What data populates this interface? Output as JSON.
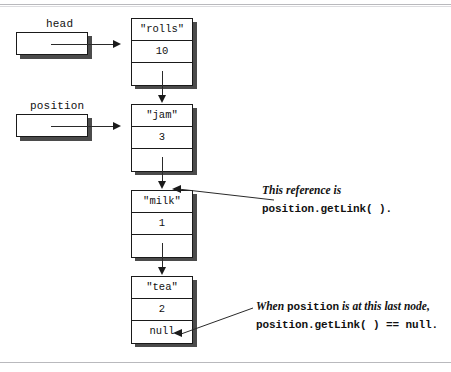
{
  "diagram": {
    "references": [
      {
        "id": "head",
        "label": "head",
        "points_to": "node-rolls"
      },
      {
        "id": "position",
        "label": "position",
        "points_to": "node-jam"
      }
    ],
    "nodes": [
      {
        "id": "node-rolls",
        "data": "\"rolls\"",
        "count": "10",
        "link": ""
      },
      {
        "id": "node-jam",
        "data": "\"jam\"",
        "count": "3",
        "link": ""
      },
      {
        "id": "node-milk",
        "data": "\"milk\"",
        "count": "1",
        "link": ""
      },
      {
        "id": "node-tea",
        "data": "\"tea\"",
        "count": "2",
        "link": "null"
      }
    ],
    "annotations": [
      {
        "id": "annotation-getlink",
        "line1_italic": "This reference is",
        "line2_mono": "position.getLink( )."
      },
      {
        "id": "annotation-null",
        "line1_prefix_italic": "When ",
        "line1_mono": "position",
        "line1_suffix_italic": " is at this last node,",
        "line2_mono": "position.getLink( ) == null."
      }
    ],
    "colors": {
      "ink": "#111111",
      "stroke": "#1a1a1a",
      "shadow": "#4b4b4b",
      "rule": "#b9b9bd",
      "paper": "#ffffff"
    }
  }
}
